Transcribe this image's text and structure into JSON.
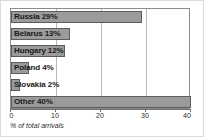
{
  "chart_data": {
    "type": "bar",
    "orientation": "horizontal",
    "title": "",
    "xlabel": "% of total arrivals",
    "ylabel": "",
    "xlim": [
      0,
      40
    ],
    "xticks": [
      0,
      10,
      20,
      30,
      40
    ],
    "xtick_labels": [
      "0",
      "10",
      "20",
      "30",
      "40"
    ],
    "grid": true,
    "grid_axis": "x",
    "legend": false,
    "categories": [
      "Russia",
      "Belarus",
      "Hungary",
      "Poland",
      "Slovakia",
      "Other"
    ],
    "values": [
      29,
      13,
      12,
      4,
      2,
      40
    ],
    "bar_labels": [
      "Russia 29%",
      "Belarus 13%",
      "Hungary 12%",
      "Poland 4%",
      "Slovakia 2%",
      "Other 40%"
    ],
    "colors": {
      "bar_fill": "#9b9b9b",
      "bar_border": "#5d5d5d",
      "plot_background": "#ffffff",
      "plot_border": "#8c8c8c",
      "gridline": "#b9b9b9",
      "axis": "#6f6f6f",
      "label_text": "#1a1a1a",
      "frame_border": "#dcdcdc"
    }
  }
}
